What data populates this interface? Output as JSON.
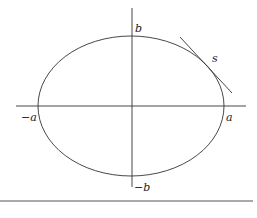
{
  "diagram": {
    "labels": {
      "neg_a": "−a",
      "pos_a": "a",
      "pos_b": "b",
      "neg_b": "−b",
      "tangent": "s"
    },
    "ellipse": {
      "cx": 131,
      "cy": 106,
      "rx": 93,
      "ry": 70
    },
    "colors": {
      "stroke": "#333333",
      "background": "#ffffff",
      "rule": "#555555"
    }
  }
}
